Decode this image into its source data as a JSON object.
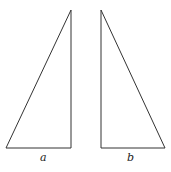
{
  "figure": {
    "triangles": [
      {
        "label": "a",
        "points": [
          [
            6,
            148
          ],
          [
            71,
            148
          ],
          [
            71,
            10
          ]
        ]
      },
      {
        "label": "b",
        "points": [
          [
            101,
            10
          ],
          [
            101,
            148
          ],
          [
            165,
            148
          ]
        ]
      }
    ],
    "stroke_color": "#333333"
  }
}
